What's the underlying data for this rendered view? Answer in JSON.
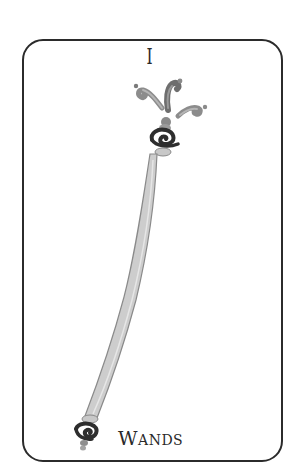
{
  "card": {
    "numeral": "I",
    "suit_label": "Wands",
    "suit_cap": "W",
    "suit_rest": "ANDS",
    "subject": "wand-staff",
    "colors": {
      "frame": "#2b2b2b",
      "background": "#ffffff",
      "text": "#2a2a2a",
      "shaft": "#c9c9c9",
      "shaft_outline": "#8a8a8a",
      "spiral": "#2e2e2e",
      "flame": "#8c8c8c"
    }
  }
}
